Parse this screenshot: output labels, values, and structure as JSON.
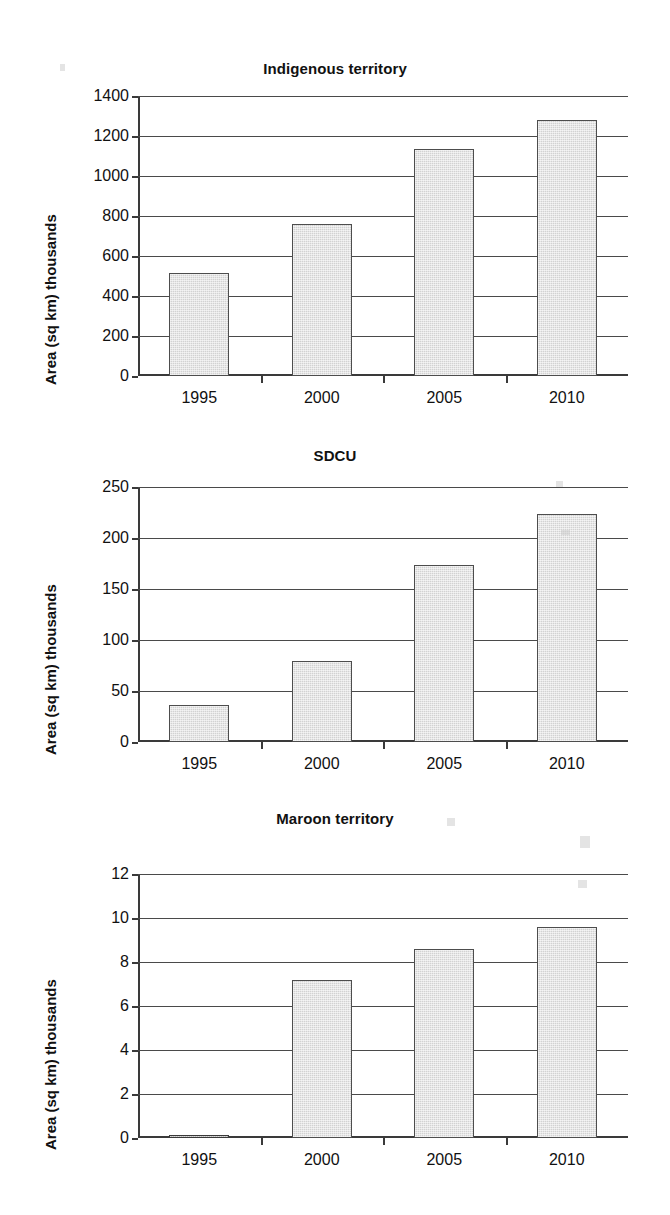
{
  "figure": {
    "background_color": "#ffffff",
    "bar_fill_color": "#d2d2d2",
    "bar_edge_color": "#4d4d4d",
    "axis_color": "#3a3a3a",
    "panel_count": 3
  },
  "chart_data": [
    {
      "type": "bar",
      "title": "Indigenous territory",
      "xlabel": "",
      "ylabel": "Area (sq km) thousands",
      "categories": [
        "1995",
        "2000",
        "2005",
        "2010"
      ],
      "values": [
        513,
        760,
        1136,
        1281
      ],
      "ylim": [
        0,
        1400
      ],
      "yticks": [
        0,
        200,
        400,
        600,
        800,
        1000,
        1200,
        1400
      ],
      "ytick_labels": [
        "0",
        "200",
        "400",
        "600",
        "800",
        "1000",
        "1200",
        "1400"
      ],
      "grid": true,
      "legend": "none"
    },
    {
      "type": "bar",
      "title": "SDCU",
      "xlabel": "",
      "ylabel": "Area (sq km) thousands",
      "categories": [
        "1995",
        "2000",
        "2005",
        "2010"
      ],
      "values": [
        36,
        79,
        174,
        224
      ],
      "ylim": [
        0,
        250
      ],
      "yticks": [
        0,
        50,
        100,
        150,
        200,
        250
      ],
      "ytick_labels": [
        "0",
        "50",
        "100",
        "150",
        "200",
        "250"
      ],
      "grid": true,
      "legend": "none"
    },
    {
      "type": "bar",
      "title": "Maroon territory",
      "xlabel": "",
      "ylabel": "Area (sq km) thousands",
      "categories": [
        "1995",
        "2000",
        "2005",
        "2010"
      ],
      "values": [
        0.05,
        7.2,
        8.6,
        9.6
      ],
      "ylim": [
        0,
        12
      ],
      "yticks": [
        0,
        2,
        4,
        6,
        8,
        10,
        12
      ],
      "ytick_labels": [
        "0",
        "2",
        "4",
        "6",
        "8",
        "10",
        "12"
      ],
      "grid": true,
      "legend": "none"
    }
  ]
}
